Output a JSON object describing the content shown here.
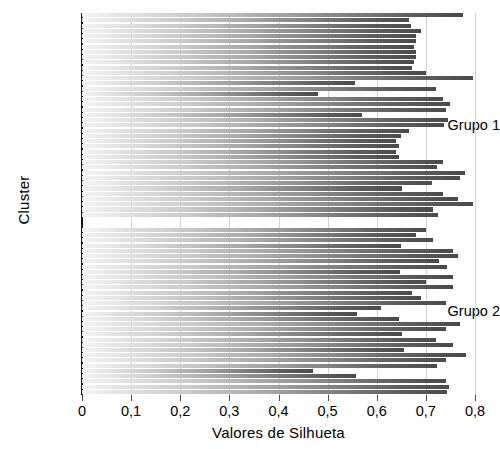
{
  "chart_data": {
    "type": "bar",
    "orientation": "horizontal",
    "title": "",
    "xlabel": "Valores de Silhueta",
    "ylabel": "Cluster",
    "xlim": [
      0,
      0.8
    ],
    "ylim_categories": [
      "Grupo 1",
      "Grupo 2"
    ],
    "xticks": [
      0,
      0.1,
      0.2,
      0.3,
      0.4,
      0.5,
      0.6,
      0.7,
      0.8
    ],
    "xticklabels": [
      "0",
      "0,1",
      "0,2",
      "0,3",
      "0,4",
      "0,5",
      "0,6",
      "0,7",
      "0,8"
    ],
    "yticklabels": [
      "Grupo 1",
      "Grupo 2"
    ],
    "grid": "vertical",
    "legend": null,
    "bar_fill": "gradient-light-to-dark-gray",
    "groups": [
      {
        "name": "Grupo 1",
        "values": [
          0.775,
          0.665,
          0.67,
          0.69,
          0.68,
          0.68,
          0.675,
          0.68,
          0.68,
          0.676,
          0.672,
          0.7,
          0.795,
          0.555,
          0.72,
          0.48,
          0.735,
          0.75,
          0.74,
          0.57,
          0.745,
          0.736,
          0.665,
          0.65,
          0.64,
          0.645,
          0.64,
          0.645,
          0.735,
          0.723,
          0.78,
          0.77,
          0.712,
          0.652,
          0.735,
          0.765,
          0.795,
          0.715,
          0.725
        ]
      },
      {
        "name": "Grupo 2",
        "values": [
          0.7,
          0.68,
          0.715,
          0.65,
          0.755,
          0.765,
          0.726,
          0.742,
          0.648,
          0.755,
          0.7,
          0.755,
          0.672,
          0.69,
          0.74,
          0.608,
          0.56,
          0.645,
          0.77,
          0.74,
          0.652,
          0.72,
          0.755,
          0.656,
          0.782,
          0.74,
          0.722,
          0.47,
          0.558,
          0.74,
          0.748,
          0.742
        ]
      }
    ]
  }
}
